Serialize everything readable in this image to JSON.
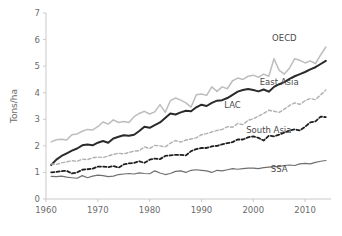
{
  "chart_data": {
    "type": "line",
    "title": "",
    "xlabel": "",
    "ylabel": "Tons/ha",
    "xlim": [
      1960,
      2015
    ],
    "ylim": [
      0,
      7
    ],
    "xticks": [
      1960,
      1970,
      1980,
      1990,
      2000,
      2010
    ],
    "yticks": [
      0,
      1,
      2,
      3,
      4,
      5,
      6,
      7
    ],
    "xtick_labels": [
      "1960",
      "1970",
      "1980",
      "1990",
      "2000",
      "2010"
    ],
    "ytick_labels": [
      "0",
      "1",
      "2",
      "3",
      "4",
      "5",
      "6",
      "7"
    ],
    "grid": false,
    "legend_position": "inline-end-labels",
    "x": [
      1961,
      1962,
      1963,
      1964,
      1965,
      1966,
      1967,
      1968,
      1969,
      1970,
      1971,
      1972,
      1973,
      1974,
      1975,
      1976,
      1977,
      1978,
      1979,
      1980,
      1981,
      1982,
      1983,
      1984,
      1985,
      1986,
      1987,
      1988,
      1989,
      1990,
      1991,
      1992,
      1993,
      1994,
      1995,
      1996,
      1997,
      1998,
      1999,
      2000,
      2001,
      2002,
      2003,
      2004,
      2005,
      2006,
      2007,
      2008,
      2009,
      2010,
      2011,
      2012,
      2013,
      2014
    ],
    "series": [
      {
        "name": "OECD",
        "color": "#bdbdbd",
        "style": "solid",
        "width": 1.5,
        "label_x": 2006,
        "label_y": 5.95,
        "values": [
          2.15,
          2.23,
          2.25,
          2.22,
          2.42,
          2.45,
          2.55,
          2.62,
          2.6,
          2.72,
          2.9,
          2.82,
          2.98,
          2.88,
          2.92,
          2.88,
          3.1,
          3.22,
          3.3,
          3.2,
          3.28,
          3.55,
          3.26,
          3.7,
          3.8,
          3.72,
          3.62,
          3.46,
          3.92,
          3.95,
          3.9,
          4.22,
          4.05,
          4.22,
          4.15,
          4.45,
          4.55,
          4.5,
          4.62,
          4.66,
          4.58,
          4.7,
          4.62,
          5.28,
          4.84,
          4.7,
          4.93,
          5.28,
          5.22,
          5.12,
          5.2,
          5.1,
          5.42,
          5.72
        ]
      },
      {
        "name": "East Asia",
        "color": "#2a2a2a",
        "style": "solid",
        "width": 2.0,
        "label_x": 2005,
        "label_y": 4.28,
        "values": [
          1.28,
          1.48,
          1.62,
          1.72,
          1.82,
          1.9,
          2.02,
          2.05,
          2.02,
          2.12,
          2.18,
          2.12,
          2.28,
          2.34,
          2.4,
          2.38,
          2.42,
          2.56,
          2.72,
          2.68,
          2.78,
          2.88,
          3.05,
          3.22,
          3.18,
          3.26,
          3.32,
          3.3,
          3.45,
          3.55,
          3.5,
          3.62,
          3.7,
          3.72,
          3.8,
          3.92,
          4.04,
          4.1,
          4.14,
          4.1,
          4.05,
          4.12,
          4.04,
          4.22,
          4.32,
          4.4,
          4.52,
          4.62,
          4.7,
          4.78,
          4.88,
          4.96,
          5.08,
          5.2
        ]
      },
      {
        "name": "LAC",
        "color": "#b0b0b0",
        "style": "dashed",
        "width": 1.4,
        "label_x": 1996,
        "label_y": 3.42,
        "values": [
          1.32,
          1.3,
          1.36,
          1.4,
          1.44,
          1.42,
          1.5,
          1.48,
          1.55,
          1.58,
          1.56,
          1.62,
          1.68,
          1.72,
          1.7,
          1.75,
          1.8,
          1.82,
          1.96,
          1.9,
          2.02,
          2.0,
          1.96,
          2.1,
          2.2,
          2.14,
          2.22,
          2.26,
          2.3,
          2.42,
          2.46,
          2.52,
          2.58,
          2.62,
          2.72,
          2.7,
          2.84,
          2.8,
          2.96,
          3.02,
          3.12,
          3.22,
          3.34,
          3.3,
          3.26,
          3.38,
          3.52,
          3.62,
          3.56,
          3.7,
          3.78,
          3.74,
          3.92,
          4.1
        ]
      },
      {
        "name": "South Asia",
        "color": "#1f1f1f",
        "style": "dashed",
        "width": 1.8,
        "label_x": 2003,
        "label_y": 2.48,
        "values": [
          1.0,
          1.02,
          1.05,
          1.06,
          0.96,
          1.0,
          1.1,
          1.12,
          1.14,
          1.22,
          1.22,
          1.2,
          1.24,
          1.18,
          1.3,
          1.34,
          1.36,
          1.42,
          1.36,
          1.48,
          1.52,
          1.5,
          1.62,
          1.64,
          1.66,
          1.66,
          1.64,
          1.8,
          1.88,
          1.92,
          1.92,
          1.98,
          2.0,
          2.06,
          2.1,
          2.14,
          2.24,
          2.24,
          2.32,
          2.36,
          2.3,
          2.2,
          2.38,
          2.36,
          2.42,
          2.5,
          2.58,
          2.62,
          2.58,
          2.72,
          2.88,
          2.92,
          3.1,
          3.08
        ]
      },
      {
        "name": "SSA",
        "color": "#6f6f6f",
        "style": "solid",
        "width": 1.2,
        "label_x": 2005,
        "label_y": 1.02,
        "values": [
          0.85,
          0.84,
          0.86,
          0.82,
          0.8,
          0.78,
          0.88,
          0.8,
          0.86,
          0.9,
          0.88,
          0.84,
          0.86,
          0.92,
          0.94,
          0.96,
          0.94,
          0.98,
          0.96,
          0.95,
          1.06,
          0.98,
          0.92,
          0.96,
          1.04,
          1.06,
          1.0,
          1.08,
          1.1,
          1.08,
          1.06,
          1.0,
          1.08,
          1.06,
          1.1,
          1.14,
          1.12,
          1.14,
          1.16,
          1.16,
          1.14,
          1.18,
          1.2,
          1.22,
          1.22,
          1.26,
          1.28,
          1.26,
          1.32,
          1.34,
          1.32,
          1.38,
          1.42,
          1.45
        ]
      }
    ]
  },
  "axes": {
    "ylabel": "Tons/ha"
  }
}
